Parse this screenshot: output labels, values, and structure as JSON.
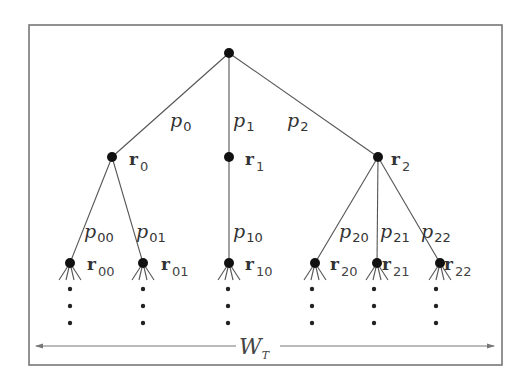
{
  "diagram": {
    "type": "tree",
    "root": {
      "x": 229,
      "y": 53
    },
    "level1": [
      {
        "id": "r0",
        "label": "r",
        "sub": "0",
        "x": 112,
        "y": 157,
        "edge_label": "p",
        "edge_sub": "0"
      },
      {
        "id": "r1",
        "label": "r",
        "sub": "1",
        "x": 229,
        "y": 157,
        "edge_label": "p",
        "edge_sub": "1"
      },
      {
        "id": "r2",
        "label": "r",
        "sub": "2",
        "x": 378,
        "y": 157,
        "edge_label": "p",
        "edge_sub": "2"
      }
    ],
    "level2": [
      {
        "id": "r00",
        "label": "r",
        "sub": "00",
        "parent": "r0",
        "x": 70,
        "y": 263,
        "edge_label": "p",
        "edge_sub": "00"
      },
      {
        "id": "r01",
        "label": "r",
        "sub": "01",
        "parent": "r0",
        "x": 143,
        "y": 263,
        "edge_label": "p",
        "edge_sub": "01"
      },
      {
        "id": "r10",
        "label": "r",
        "sub": "10",
        "parent": "r1",
        "x": 229,
        "y": 263,
        "edge_label": "p",
        "edge_sub": "10"
      },
      {
        "id": "r20",
        "label": "r",
        "sub": "20",
        "parent": "r2",
        "x": 315,
        "y": 263,
        "edge_label": "p",
        "edge_sub": "20"
      },
      {
        "id": "r21",
        "label": "r",
        "sub": "21",
        "parent": "r2",
        "x": 377,
        "y": 263,
        "edge_label": "p",
        "edge_sub": "21"
      },
      {
        "id": "r22",
        "label": "r",
        "sub": "22",
        "parent": "r2",
        "x": 440,
        "y": 263,
        "edge_label": "p",
        "edge_sub": "22"
      }
    ],
    "continuation": "vertical-ellipsis",
    "width_label": {
      "main": "W",
      "sub": "T"
    }
  }
}
